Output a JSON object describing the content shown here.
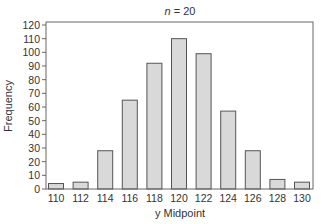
{
  "chart_data": {
    "type": "bar",
    "title": "n = 20",
    "title_parts": {
      "var": "n",
      "rest": " = 20"
    },
    "xlabel": "y Midpoint",
    "ylabel": "Frequency",
    "categories": [
      "110",
      "112",
      "114",
      "116",
      "118",
      "120",
      "122",
      "124",
      "126",
      "128",
      "130"
    ],
    "values": [
      4,
      5,
      28,
      65,
      92,
      110,
      99,
      57,
      28,
      7,
      5
    ],
    "ylim": [
      0,
      120
    ],
    "yticks": [
      0,
      10,
      20,
      30,
      40,
      50,
      60,
      70,
      80,
      90,
      100,
      110,
      120
    ],
    "grid": false,
    "legend": null,
    "colors": {
      "bar_fill": "#d9d9d9",
      "bar_stroke": "#555555",
      "frame": "#666666"
    }
  }
}
